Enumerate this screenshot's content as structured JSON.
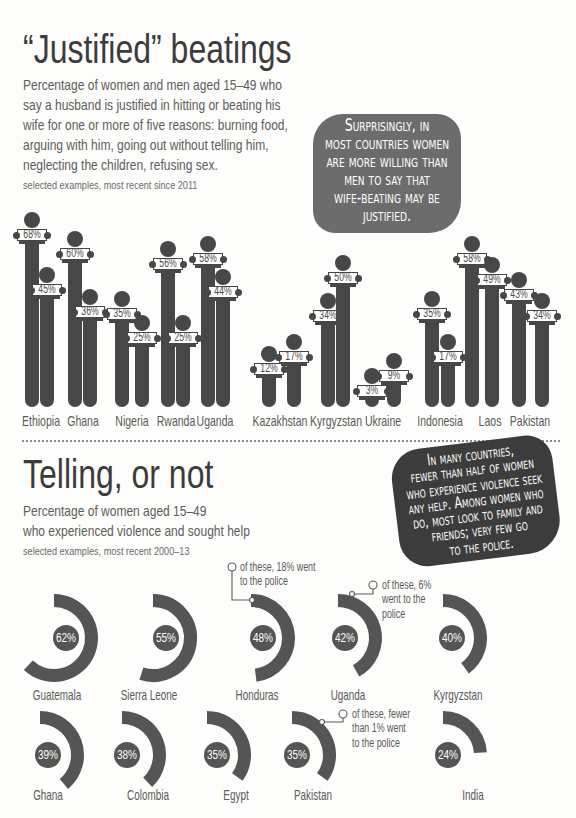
{
  "section1": {
    "title": "“Justified” beatings",
    "subtitle_lines": [
      "Percentage of women and men aged 15–49 who",
      "say a husband is justified in hitting or beating his",
      "wife for one or more of five reasons: burning food,",
      "arguing with him, going out without telling him,",
      "neglecting the children, refusing sex."
    ],
    "note": "selected examples, most recent since 2011",
    "callout_lines": [
      "Surprisingly, in",
      "most countries women",
      "are more willing than",
      "men to say that",
      "wife-beating may be",
      "justified."
    ],
    "legend": {
      "women": "women",
      "men": "men"
    }
  },
  "section2": {
    "title": "Telling, or not",
    "subtitle_lines": [
      "Percentage of women aged 15–49",
      "who experienced violence and sought help"
    ],
    "note": "selected examples, most recent 2000–13",
    "callout_lines": [
      "In many countries,",
      "fewer than half of women",
      "who experience violence seek",
      "any help. Among women who",
      "do, most look to family and",
      "friends; very few go",
      "to the police."
    ],
    "annotations": {
      "honduras": [
        "of these, 18% went",
        "to the police"
      ],
      "uganda": [
        "of these, 6%",
        "went to the",
        "police"
      ],
      "pakistan": [
        "of these, fewer",
        "than 1% went",
        "to the police"
      ]
    }
  },
  "colors": {
    "figure": "#474747",
    "arc": "#555555",
    "callout_light": "#6c6c6c",
    "callout_dark": "#3c3c3c",
    "title": "#3c3c3c",
    "text": "#5a5a5a"
  },
  "chart_data": [
    {
      "type": "bar",
      "title": "“Justified” beatings",
      "subtitle": "Percentage of women and men aged 15–49 who say a husband is justified in hitting or beating his wife for one or more of five reasons: burning food, arguing with him, going out without telling him, neglecting the children, refusing sex.",
      "note": "selected examples, most recent since 2011",
      "categories": [
        "Ethiopia",
        "Ghana",
        "Nigeria",
        "Rwanda",
        "Uganda",
        "Kazakhstan",
        "Kyrgyzstan",
        "Ukraine",
        "Indonesia",
        "Laos",
        "Pakistan"
      ],
      "series": [
        {
          "name": "women",
          "values": [
            68,
            60,
            35,
            56,
            58,
            12,
            34,
            3,
            35,
            58,
            43
          ],
          "labels": [
            "68%",
            "60%",
            "35%",
            "56%",
            "58%",
            "12%",
            "34%",
            "3%",
            "35%",
            "58%",
            "43%"
          ]
        },
        {
          "name": "men",
          "values": [
            45,
            36,
            25,
            25,
            44,
            17,
            50,
            9,
            17,
            49,
            34
          ],
          "labels": [
            "45%",
            "36%",
            "25%",
            "25%",
            "44%",
            "17%",
            "50%",
            "9%",
            "17%",
            "49%",
            "34%"
          ]
        }
      ],
      "xlabel": "",
      "ylabel": "%",
      "ylim": [
        0,
        100
      ],
      "grid": false,
      "legend": "in-bar labels: women (left bar), men (right bar)",
      "annotation": "Surprisingly, in most countries women are more willing than men to say that wife-beating may be justified."
    },
    {
      "type": "pie",
      "variant": "radial arc per country",
      "title": "Telling, or not",
      "subtitle": "Percentage of women aged 15–49 who experienced violence and sought help",
      "note": "selected examples, most recent 2000–13",
      "categories": [
        "Guatemala",
        "Sierra Leone",
        "Honduras",
        "Uganda",
        "Kyrgyzstan",
        "Ghana",
        "Colombia",
        "Egypt",
        "Pakistan",
        "India"
      ],
      "values": [
        62,
        55,
        48,
        42,
        40,
        39,
        38,
        35,
        35,
        24
      ],
      "labels": [
        "62%",
        "55%",
        "48%",
        "42%",
        "40%",
        "39%",
        "38%",
        "35%",
        "35%",
        "24%"
      ],
      "annotations": [
        {
          "category": "Honduras",
          "text": "of these, 18% went to the police"
        },
        {
          "category": "Uganda",
          "text": "of these, 6% went to the police"
        },
        {
          "category": "Pakistan",
          "text": "of these, fewer than 1% went to the police"
        }
      ],
      "callout": "In many countries, fewer than half of women who experience violence seek any help. Among women who do, most look to family and friends; very few go to the police."
    }
  ]
}
